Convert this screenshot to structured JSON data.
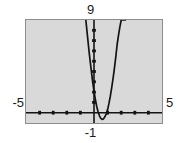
{
  "widget": {
    "kind": "graphing-calculator-plot",
    "background_color": "#ffffff",
    "plot_background_color": "#d9d9d9",
    "frame_color": "#8c8c8c",
    "ink_color": "#141414"
  },
  "labels": {
    "x_min": "-5",
    "x_max": "5",
    "y_max": "9",
    "y_min": "-1"
  },
  "chart_data": {
    "type": "line",
    "title": "",
    "subtitle": "",
    "xlabel": "",
    "ylabel": "",
    "xlim": [
      -5,
      5
    ],
    "ylim": [
      -1,
      9
    ],
    "grid": false,
    "legend": "none",
    "axes": {
      "x_axis_y_value": 0,
      "y_axis_x_value": 0,
      "x_tick_spacing": 1,
      "y_tick_spacing": 1,
      "x_ticks": [
        -4,
        -3,
        -2,
        -1,
        1,
        2,
        3,
        4
      ],
      "y_ticks": [
        1,
        2,
        3,
        4,
        5,
        6,
        7,
        8
      ],
      "tick_style": "inline-marks"
    },
    "series": [
      {
        "name": "parabola",
        "description": "narrow upward-opening parabola, vertex near (0.6, -0.6)",
        "x": [
          -0.6,
          -0.5,
          -0.4,
          -0.3,
          -0.2,
          -0.1,
          0.0,
          0.1,
          0.2,
          0.3,
          0.4,
          0.5,
          0.6,
          0.7,
          0.8,
          0.9,
          1.0,
          1.1,
          1.2,
          1.3,
          1.4,
          1.5,
          1.6,
          1.7,
          1.8,
          1.9,
          2.0,
          2.1,
          2.2,
          2.3
        ],
        "y": [
          9.0,
          7.7,
          6.4,
          5.2,
          4.1,
          3.0,
          2.1,
          1.3,
          0.6,
          0.1,
          -0.3,
          -0.55,
          -0.65,
          -0.6,
          -0.4,
          -0.1,
          0.3,
          0.9,
          1.6,
          2.4,
          3.3,
          4.3,
          5.4,
          6.6,
          7.5,
          8.3,
          9.0,
          9.0,
          9.0,
          9.0
        ]
      }
    ],
    "annotations": []
  }
}
